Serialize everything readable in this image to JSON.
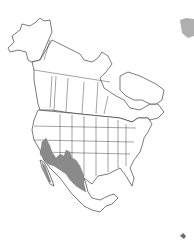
{
  "map": {
    "title": "North America range map",
    "region": "North America",
    "range_region": "Southwestern United States and Mexico",
    "colors": {
      "background": "#ffffff",
      "outline": "#222222",
      "range_fill": "#8a8a8a"
    }
  }
}
